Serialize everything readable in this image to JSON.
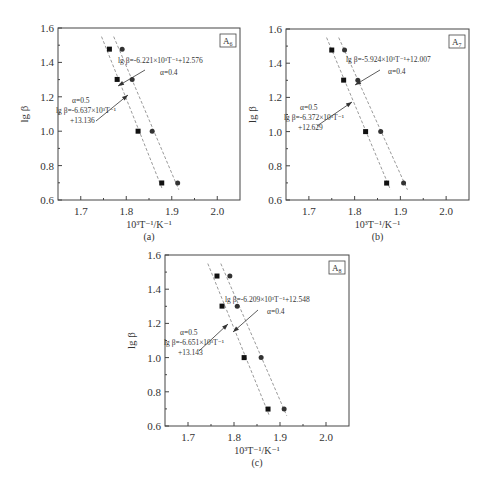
{
  "figure": {
    "panels": [
      "a",
      "b",
      "c"
    ]
  },
  "chart_data": [
    {
      "type": "scatter",
      "panel_label": "(a)",
      "sample_label": "A",
      "sample_sub": "6",
      "xlabel": "10³T⁻¹/K⁻¹",
      "ylabel": "lg β",
      "xlim": [
        1.65,
        2.05
      ],
      "ylim": [
        0.6,
        1.6
      ],
      "xticks": [
        1.7,
        1.8,
        1.9,
        2.0
      ],
      "xtick_labels": [
        "1.7",
        "1.8",
        "1.9",
        "2.0"
      ],
      "yticks": [
        0.6,
        0.8,
        1.0,
        1.2,
        1.4,
        1.6
      ],
      "ytick_labels": [
        "0.6",
        "0.8",
        "1.0",
        "1.2",
        "1.4",
        "1.6"
      ],
      "grid": false,
      "series": [
        {
          "name": "α=0.5",
          "marker": "square",
          "x": [
            1.763,
            1.78,
            1.826,
            1.878
          ],
          "y": [
            1.477,
            1.301,
            1.0,
            0.699
          ],
          "fit": {
            "slope": -6.637,
            "intercept": 13.136
          },
          "annotation": [
            "α=0.5",
            "lg β=-6.637×10³T⁻¹",
            "+13.136"
          ]
        },
        {
          "name": "α=0.4",
          "marker": "circle",
          "x": [
            1.791,
            1.813,
            1.857,
            1.913
          ],
          "y": [
            1.477,
            1.301,
            1.0,
            0.699
          ],
          "fit": {
            "slope": -6.221,
            "intercept": 12.576
          },
          "annotation": [
            "lg β=-6.221×10³T⁻¹+12.576",
            "α=0.4"
          ]
        }
      ]
    },
    {
      "type": "scatter",
      "panel_label": "(b)",
      "sample_label": "A",
      "sample_sub": "7",
      "xlabel": "10³T⁻¹/K⁻¹",
      "ylabel": "lg β",
      "xlim": [
        1.65,
        2.05
      ],
      "ylim": [
        0.6,
        1.6
      ],
      "xticks": [
        1.7,
        1.8,
        1.9,
        2.0
      ],
      "xtick_labels": [
        "1.7",
        "1.8",
        "1.9",
        "2.0"
      ],
      "yticks": [
        0.6,
        0.8,
        1.0,
        1.2,
        1.4,
        1.6
      ],
      "ytick_labels": [
        "0.6",
        "0.8",
        "1.0",
        "1.2",
        "1.4",
        "1.6"
      ],
      "grid": false,
      "series": [
        {
          "name": "α=0.5",
          "marker": "square",
          "x": [
            1.75,
            1.776,
            1.824,
            1.87
          ],
          "y": [
            1.477,
            1.301,
            1.0,
            0.699
          ],
          "fit": {
            "slope": -6.372,
            "intercept": 12.629
          },
          "annotation": [
            "α=0.5",
            "lg β=-6.372×10³T⁻¹",
            "+12.629"
          ]
        },
        {
          "name": "α=0.4",
          "marker": "circle",
          "x": [
            1.778,
            1.807,
            1.857,
            1.907
          ],
          "y": [
            1.477,
            1.301,
            1.0,
            0.699
          ],
          "fit": {
            "slope": -5.924,
            "intercept": 12.007
          },
          "annotation": [
            "lg β=-5.924×10³T⁻¹+12.007",
            "α=0.4"
          ]
        }
      ]
    },
    {
      "type": "scatter",
      "panel_label": "(c)",
      "sample_label": "A",
      "sample_sub": "8",
      "xlabel": "10³T⁻¹/K⁻¹",
      "ylabel": "lg β",
      "xlim": [
        1.65,
        2.05
      ],
      "ylim": [
        0.6,
        1.6
      ],
      "xticks": [
        1.7,
        1.8,
        1.9,
        2.0
      ],
      "xtick_labels": [
        "1.7",
        "1.8",
        "1.9",
        "2.0"
      ],
      "yticks": [
        0.6,
        0.8,
        1.0,
        1.2,
        1.4,
        1.6
      ],
      "ytick_labels": [
        "0.6",
        "0.8",
        "1.0",
        "1.2",
        "1.4",
        "1.6"
      ],
      "grid": false,
      "series": [
        {
          "name": "α=0.5",
          "marker": "square",
          "x": [
            1.763,
            1.774,
            1.822,
            1.874
          ],
          "y": [
            1.477,
            1.301,
            1.0,
            0.699
          ],
          "fit": {
            "slope": -6.651,
            "intercept": 13.143
          },
          "annotation": [
            "α=0.5",
            "lg β=-6.651×10³T⁻¹",
            "+13.143"
          ]
        },
        {
          "name": "α=0.4",
          "marker": "circle",
          "x": [
            1.791,
            1.807,
            1.859,
            1.909
          ],
          "y": [
            1.477,
            1.301,
            1.0,
            0.699
          ],
          "fit": {
            "slope": -6.209,
            "intercept": 12.548
          },
          "annotation": [
            "lg β=-6.209×10³T⁻¹+12.548",
            "α=0.4"
          ]
        }
      ]
    }
  ],
  "layout": {
    "panels": [
      {
        "left": 58,
        "top": 28,
        "width": 182,
        "height": 172,
        "annot": {
          "a05": [
            56,
            103
          ],
          "a04": [
            118,
            63
          ],
          "arrow05": [
            [
              96,
              121
            ],
            [
              128,
              95
            ]
          ],
          "arrow04": [
            [
              145,
              70
            ],
            [
              118,
              86
            ]
          ]
        }
      },
      {
        "left": 286,
        "top": 29,
        "width": 183,
        "height": 171,
        "annot": {
          "a05": [
            284,
            110
          ],
          "a04": [
            346,
            62
          ],
          "arrow05": [
            [
              317,
              126
            ],
            [
              352,
              102
            ]
          ],
          "arrow04": [
            [
              380,
              70
            ],
            [
              355,
              85
            ]
          ]
        }
      },
      {
        "left": 165,
        "top": 255,
        "width": 184,
        "height": 171,
        "annot": {
          "a05": [
            164,
            335
          ],
          "a04": [
            225,
            302
          ],
          "arrow05": [
            [
              199,
              351
            ],
            [
              228,
              324
            ]
          ],
          "arrow04": [
            [
              258,
              310
            ],
            [
              233,
              332
            ]
          ]
        }
      }
    ]
  },
  "colors": {
    "axis": "#444444",
    "marker": "#111111",
    "fit_line": "#9a9a9a",
    "text": "#333333"
  }
}
